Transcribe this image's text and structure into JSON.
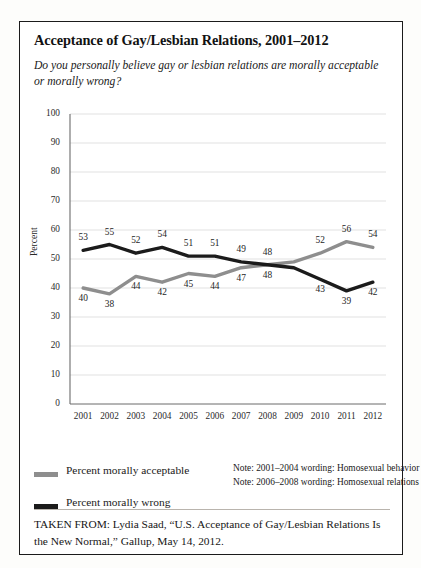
{
  "figure": {
    "title": "Acceptance of Gay/Lesbian Relations, 2001–2012",
    "subtitle": "Do you personally believe gay or lesbian relations are morally acceptable or morally wrong?",
    "source": "TAKEN FROM: Lydia Saad, “U.S. Acceptance of Gay/Lesbian Relations Is the New Normal,” Gallup, May 14, 2012."
  },
  "legend": {
    "acceptable_label": "Percent morally acceptable",
    "wrong_label": "Percent morally wrong",
    "acceptable_color": "#8e8e8e",
    "wrong_color": "#1b1b1b",
    "note_1": "Note: 2001–2004 wording: Homosexual behavior",
    "note_2": "Note: 2006–2008 wording: Homosexual relations"
  },
  "chart_data": {
    "type": "line",
    "title": "Acceptance of Gay/Lesbian Relations, 2001–2012",
    "xlabel": "",
    "ylabel": "Percent",
    "ylim": [
      0,
      100
    ],
    "ytick_step": 10,
    "yticks": [
      100,
      90,
      80,
      70,
      60,
      50,
      40,
      30,
      20,
      10,
      0
    ],
    "grid": true,
    "legend_position": "below-left",
    "categories": [
      "2001",
      "2002",
      "2003",
      "2004",
      "2005",
      "2006",
      "2007",
      "2008",
      "2009",
      "2010",
      "2011",
      "2012"
    ],
    "series": [
      {
        "name": "Percent morally acceptable",
        "color": "#8e8e8e",
        "values": [
          40,
          38,
          44,
          42,
          45,
          44,
          47,
          48,
          49,
          52,
          56,
          54
        ],
        "labels": [
          "40",
          "38",
          "44",
          "42",
          "45",
          "44",
          "47",
          "48",
          "",
          "52",
          "56",
          "54"
        ],
        "label_side": [
          "below",
          "below",
          "below",
          "below",
          "below",
          "below",
          "below",
          "below",
          "",
          "above",
          "above",
          "above"
        ]
      },
      {
        "name": "Percent morally wrong",
        "color": "#1b1b1b",
        "values": [
          53,
          55,
          52,
          54,
          51,
          51,
          49,
          48,
          47,
          43,
          39,
          42
        ],
        "labels": [
          "53",
          "55",
          "52",
          "54",
          "51",
          "51",
          "49",
          "48",
          "",
          "43",
          "39",
          "42"
        ],
        "label_side": [
          "above",
          "above",
          "above",
          "above",
          "above",
          "above",
          "above",
          "above",
          "",
          "below",
          "below",
          "below"
        ]
      }
    ]
  }
}
